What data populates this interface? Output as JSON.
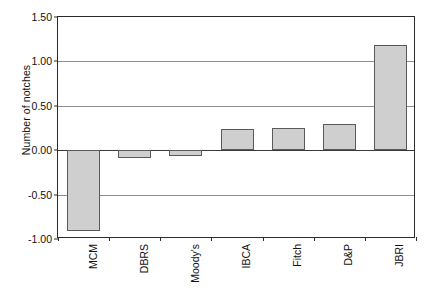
{
  "chart_data": {
    "type": "bar",
    "title": "",
    "xlabel": "",
    "ylabel": "Number of notches",
    "categories": [
      "MCM",
      "DBRS",
      "Moody's",
      "IBCA",
      "Fitch",
      "D&P",
      "JBRI"
    ],
    "values": [
      -0.91,
      -0.09,
      -0.06,
      0.24,
      0.25,
      0.29,
      1.18
    ],
    "ylim": [
      -1.0,
      1.5
    ],
    "ytick_labels": [
      "1.50",
      "1.00",
      "0.50",
      "0.00",
      "-0.50",
      "-1.00"
    ],
    "ytick_values": [
      1.5,
      1.0,
      0.5,
      0.0,
      -0.5,
      -1.0
    ],
    "grid": true,
    "gridlines_at": [
      1.0,
      0.5,
      0.0,
      -0.5
    ],
    "legend": "none",
    "bar_fill_color": "#cfcfcf",
    "bar_border_color": "#5a5a5a",
    "axis_color": "#2b2b2b",
    "grid_color": "#8e8e8e",
    "background_color": "#ffffff"
  }
}
